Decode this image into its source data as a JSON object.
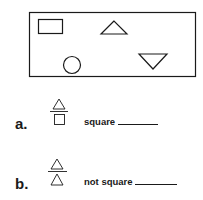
{
  "figure": {
    "shapes": [
      "rectangle",
      "triangle-up",
      "circle",
      "triangle-down"
    ]
  },
  "items": [
    {
      "label": "a.",
      "fraction": {
        "numerator": "triangle",
        "denominator": "square"
      },
      "answer_text": "square",
      "answer_value": ""
    },
    {
      "label": "b.",
      "fraction": {
        "numerator": "triangle",
        "denominator": "triangle"
      },
      "answer_text": "not square",
      "answer_value": ""
    }
  ]
}
